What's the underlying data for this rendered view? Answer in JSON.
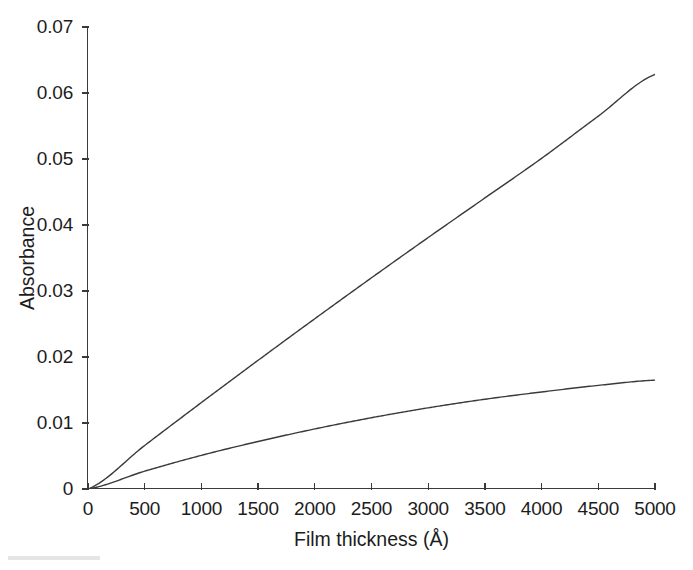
{
  "figure": {
    "width": 693,
    "height": 570,
    "background": "#ffffff",
    "line_color": "#3a3a3a",
    "axis_color": "#3a3a3a",
    "text_color": "#1c1c1c"
  },
  "axes": {
    "x_title": "Film thickness (Å)",
    "y_title": "Absorbance",
    "x_ticks": [
      "0",
      "500",
      "1000",
      "1500",
      "2000",
      "2500",
      "3000",
      "3500",
      "4000",
      "4500",
      "5000"
    ],
    "y_ticks": [
      "0",
      "0.01",
      "0.02",
      "0.03",
      "0.04",
      "0.05",
      "0.06",
      "0.07"
    ],
    "x_range": [
      0,
      5000
    ],
    "y_range": [
      0,
      0.07
    ],
    "grid": false,
    "frame": "left-bottom-only",
    "legend": "none"
  },
  "chart_data": {
    "type": "line",
    "title": "",
    "xlabel": "Film thickness (Å)",
    "ylabel": "Absorbance",
    "xlim": [
      0,
      5000
    ],
    "ylim": [
      0,
      0.07
    ],
    "xticks": [
      0,
      500,
      1000,
      1500,
      2000,
      2500,
      3000,
      3500,
      4000,
      4500,
      5000
    ],
    "yticks": [
      0,
      0.01,
      0.02,
      0.03,
      0.04,
      0.05,
      0.06,
      0.07
    ],
    "grid": false,
    "legend_position": "none",
    "x": [
      0,
      500,
      1000,
      1500,
      2000,
      2500,
      3000,
      3500,
      4000,
      4500,
      5000
    ],
    "series": [
      {
        "name": "upper-curve",
        "color": "#3a3a3a",
        "values": [
          0,
          0.0066,
          0.0131,
          0.0195,
          0.0258,
          0.032,
          0.0381,
          0.0441,
          0.0501,
          0.0565,
          0.0628
        ]
      },
      {
        "name": "lower-curve",
        "color": "#3a3a3a",
        "values": [
          0,
          0.0027,
          0.0051,
          0.0072,
          0.0091,
          0.0108,
          0.0123,
          0.0136,
          0.0147,
          0.0157,
          0.0165
        ]
      }
    ]
  }
}
